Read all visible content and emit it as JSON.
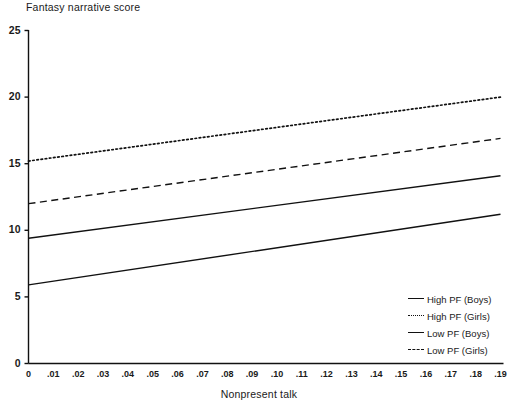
{
  "chart_data": {
    "type": "line",
    "title": "",
    "xlabel": "Nonpresent talk",
    "ylabel": "Fantasy narrative score",
    "xlim": [
      0,
      0.19
    ],
    "ylim": [
      0,
      25
    ],
    "grid": false,
    "legend_position": "bottom-right",
    "x_tick_labels": [
      "0",
      ".01",
      ".02",
      ".03",
      ".04",
      ".05",
      ".06",
      ".07",
      ".08",
      ".09",
      ".10",
      ".11",
      ".12",
      ".13",
      ".14",
      ".15",
      ".16",
      ".17",
      ".18",
      ".19"
    ],
    "x_tick_values": [
      0,
      0.01,
      0.02,
      0.03,
      0.04,
      0.05,
      0.06,
      0.07,
      0.08,
      0.09,
      0.1,
      0.11,
      0.12,
      0.13,
      0.14,
      0.15,
      0.16,
      0.17,
      0.18,
      0.19
    ],
    "y_tick_labels": [
      "0",
      "5",
      "10",
      "15",
      "20",
      "25"
    ],
    "y_tick_values": [
      0,
      5,
      10,
      15,
      20,
      25
    ],
    "x": [
      0,
      0.19
    ],
    "series": [
      {
        "name": "High PF (Boys)",
        "style": "solid",
        "color": "#111111",
        "values": [
          9.4,
          14.1
        ]
      },
      {
        "name": "High PF (Girls)",
        "style": "dotted",
        "color": "#111111",
        "values": [
          15.2,
          20.0
        ]
      },
      {
        "name": "Low PF (Boys)",
        "style": "solid",
        "color": "#111111",
        "values": [
          5.9,
          11.2
        ]
      },
      {
        "name": "Low PF (Girls)",
        "style": "dashed",
        "color": "#111111",
        "values": [
          12.0,
          16.9
        ]
      }
    ]
  },
  "legend": {
    "entries": [
      {
        "label": "High PF (Boys)",
        "style": "solid"
      },
      {
        "label": "High PF (Girls)",
        "style": "dotted"
      },
      {
        "label": "Low PF (Boys)",
        "style": "solid"
      },
      {
        "label": "Low PF (Girls)",
        "style": "dashed"
      }
    ]
  },
  "axis_color": "#111111",
  "background": "#ffffff"
}
